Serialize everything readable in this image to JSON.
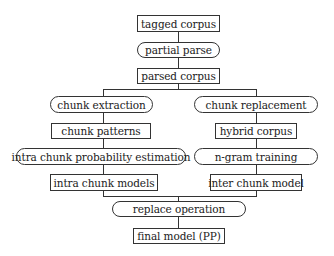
{
  "diagram": {
    "type": "flowchart",
    "nodes": {
      "tagged_corpus": "tagged corpus",
      "partial_parse": "partial parse",
      "parsed_corpus": "parsed corpus",
      "chunk_extraction": "chunk extraction",
      "chunk_replacement": "chunk replacement",
      "chunk_patterns": "chunk patterns",
      "hybrid_corpus": "hybrid corpus",
      "intra_chunk_probability_estimation": "intra chunk probability estimation",
      "ngram_training": "n-gram training",
      "intra_chunk_models": "intra chunk models",
      "inter_chunk_model": "inter chunk model",
      "replace_operation": "replace operation",
      "final_model": "final model (PP)"
    },
    "edges": [
      [
        "tagged corpus",
        "partial parse"
      ],
      [
        "partial parse",
        "parsed corpus"
      ],
      [
        "parsed corpus",
        "chunk extraction"
      ],
      [
        "parsed corpus",
        "chunk replacement"
      ],
      [
        "chunk extraction",
        "chunk patterns"
      ],
      [
        "chunk patterns",
        "intra chunk probability estimation"
      ],
      [
        "intra chunk probability estimation",
        "intra chunk models"
      ],
      [
        "chunk replacement",
        "hybrid corpus"
      ],
      [
        "hybrid corpus",
        "n-gram training"
      ],
      [
        "n-gram training",
        "inter chunk model"
      ],
      [
        "intra chunk models",
        "replace operation"
      ],
      [
        "inter chunk model",
        "replace operation"
      ],
      [
        "replace operation",
        "final model (PP)"
      ]
    ]
  }
}
